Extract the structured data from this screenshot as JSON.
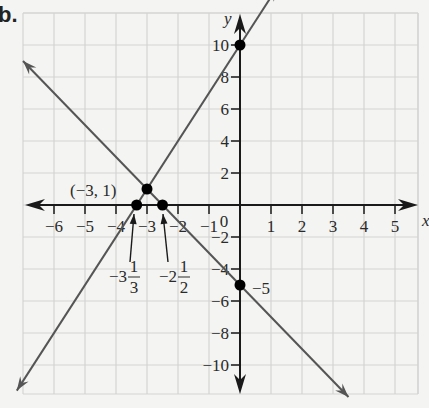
{
  "problem_label": "b.",
  "chart_data": {
    "type": "line",
    "title": "",
    "xlabel": "x",
    "ylabel": "y",
    "xlim": [
      -7,
      5.8
    ],
    "ylim": [
      -11.8,
      12
    ],
    "grid": true,
    "x_ticks": [
      -6,
      -5,
      -4,
      -3,
      -2,
      -1,
      1,
      2,
      3,
      4,
      5
    ],
    "x_tick_labels": [
      "−6",
      "−5",
      "−4",
      "−3",
      "−2",
      "−1",
      "1",
      "2",
      "3",
      "4",
      "5"
    ],
    "y_ticks": [
      -10,
      -8,
      -6,
      -4,
      -2,
      2,
      4,
      6,
      8,
      10
    ],
    "y_tick_labels": [
      "−10",
      "−8",
      "−6",
      "−4",
      "−2",
      "2",
      "4",
      "6",
      "8",
      "10"
    ],
    "origin_label": "0",
    "series": [
      {
        "name": "line-1",
        "equation": "y = 3x + 10",
        "slope": 3,
        "intercept": 10,
        "x": [
          -7.2,
          1.2
        ],
        "y": [
          -11.6,
          13.6
        ]
      },
      {
        "name": "line-2",
        "equation": "y = -2x - 5",
        "slope": -2,
        "intercept": -5,
        "x": [
          -7,
          3.5
        ],
        "y": [
          9,
          -12
        ]
      }
    ],
    "points": [
      {
        "x": 0,
        "y": 10,
        "label": ""
      },
      {
        "x": -3,
        "y": 1,
        "label": "(−3, 1)"
      },
      {
        "x": -3.3333,
        "y": 0,
        "label": "−3 1/3"
      },
      {
        "x": -2.5,
        "y": 0,
        "label": "−2 1/2"
      },
      {
        "x": 0,
        "y": -5,
        "label": "−5"
      }
    ],
    "annotations": {
      "intersection": "(−3, 1)",
      "x_intercept_1": {
        "whole": "−3",
        "num": "1",
        "den": "3"
      },
      "x_intercept_2": {
        "whole": "−2",
        "num": "1",
        "den": "2"
      },
      "y_intercept_2": "−5"
    },
    "colors": {
      "lines": "#555555",
      "axes": "#1a1a1a",
      "grid": "#d4d4d4",
      "points": "#000000",
      "background": "#f4f4f2"
    }
  }
}
